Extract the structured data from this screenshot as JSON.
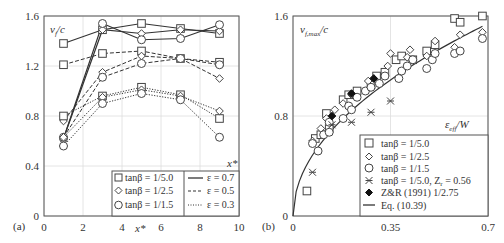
{
  "chart_data": [
    {
      "panel": "(a)",
      "type": "line",
      "ylabel": "v_f/c",
      "xlabel": "x*",
      "xlabel_inner": "x*",
      "xlim": [
        0,
        10
      ],
      "ylim": [
        0,
        1.6
      ],
      "xticks": [
        0,
        2,
        4,
        6,
        8,
        10
      ],
      "yticks": [
        0,
        0.4,
        0.8,
        1.2,
        1.6
      ],
      "grid": true,
      "x": [
        1,
        3,
        5,
        7,
        9
      ],
      "series": [
        {
          "name": "tanβ = 1/5.0, ε = 0.7",
          "marker": "square",
          "line": "solid",
          "values": [
            1.38,
            1.49,
            1.54,
            1.5,
            1.46
          ]
        },
        {
          "name": "tanβ = 1/2.5, ε = 0.7",
          "marker": "diamond",
          "line": "solid",
          "values": [
            0.62,
            1.49,
            1.46,
            1.49,
            1.48
          ]
        },
        {
          "name": "tanβ = 1/1.5, ε = 0.7",
          "marker": "circle",
          "line": "solid",
          "values": [
            0.62,
            1.54,
            1.41,
            1.42,
            1.53
          ]
        },
        {
          "name": "tanβ = 1/5.0, ε = 0.5",
          "marker": "square",
          "line": "dashed",
          "values": [
            1.21,
            1.3,
            1.32,
            1.26,
            1.23
          ]
        },
        {
          "name": "tanβ = 1/2.5, ε = 0.5",
          "marker": "diamond",
          "line": "dashed",
          "values": [
            0.76,
            1.15,
            1.28,
            1.26,
            1.1
          ]
        },
        {
          "name": "tanβ = 1/1.5, ε = 0.5",
          "marker": "circle",
          "line": "dashed",
          "values": [
            0.63,
            1.11,
            1.22,
            1.26,
            1.21
          ]
        },
        {
          "name": "tanβ = 1/5.0, ε = 0.3",
          "marker": "square",
          "line": "dotted",
          "values": [
            0.8,
            0.96,
            1.03,
            0.97,
            0.78
          ]
        },
        {
          "name": "tanβ = 1/2.5, ε = 0.3",
          "marker": "diamond",
          "line": "dotted",
          "values": [
            0.63,
            0.95,
            1.01,
            0.96,
            0.84
          ]
        },
        {
          "name": "tanβ = 1/1.5, ε = 0.3",
          "marker": "circle",
          "line": "dotted",
          "values": [
            0.56,
            0.9,
            0.98,
            0.93,
            0.63
          ]
        }
      ],
      "legend": {
        "position": "lower right",
        "markers": [
          "tanβ = 1/5.0",
          "tanβ = 1/2.5",
          "tanβ = 1/1.5"
        ],
        "lines": [
          "ε = 0.7",
          "ε = 0.5",
          "ε = 0.3"
        ]
      }
    },
    {
      "panel": "(b)",
      "type": "scatter",
      "ylabel": "v_f,max/c",
      "xlabel": "ε_eff/W",
      "xlim": [
        0,
        0.7
      ],
      "ylim": [
        0,
        1.6
      ],
      "xticks": [
        0,
        0.35,
        0.7
      ],
      "yticks": [
        0,
        0.8,
        1.6
      ],
      "grid": true,
      "series": [
        {
          "name": "tanβ = 1/5.0",
          "marker": "square",
          "points": [
            [
              0.05,
              0.2
            ],
            [
              0.08,
              0.62
            ],
            [
              0.1,
              0.65
            ],
            [
              0.12,
              0.82
            ],
            [
              0.13,
              0.7
            ],
            [
              0.18,
              0.93
            ],
            [
              0.2,
              0.97
            ],
            [
              0.23,
              1.0
            ],
            [
              0.28,
              1.05
            ],
            [
              0.3,
              1.12
            ],
            [
              0.33,
              1.15
            ],
            [
              0.37,
              1.25
            ],
            [
              0.39,
              1.28
            ],
            [
              0.43,
              1.25
            ],
            [
              0.48,
              1.32
            ],
            [
              0.51,
              1.37
            ],
            [
              0.58,
              1.58
            ],
            [
              0.6,
              1.55
            ],
            [
              0.68,
              1.6
            ]
          ]
        },
        {
          "name": "tanβ = 1/2.5",
          "marker": "diamond",
          "points": [
            [
              0.07,
              0.6
            ],
            [
              0.1,
              0.7
            ],
            [
              0.12,
              0.78
            ],
            [
              0.15,
              0.85
            ],
            [
              0.18,
              0.9
            ],
            [
              0.21,
              0.97
            ],
            [
              0.27,
              1.08
            ],
            [
              0.29,
              1.1
            ],
            [
              0.34,
              1.2
            ],
            [
              0.35,
              1.3
            ],
            [
              0.41,
              1.27
            ],
            [
              0.42,
              1.33
            ],
            [
              0.48,
              1.28
            ],
            [
              0.51,
              1.4
            ],
            [
              0.58,
              1.35
            ],
            [
              0.6,
              1.45
            ],
            [
              0.68,
              1.47
            ]
          ]
        },
        {
          "name": "tanβ = 1/1.5",
          "marker": "circle",
          "points": [
            [
              0.07,
              0.58
            ],
            [
              0.09,
              0.52
            ],
            [
              0.11,
              0.65
            ],
            [
              0.13,
              0.67
            ],
            [
              0.13,
              0.75
            ],
            [
              0.18,
              0.78
            ],
            [
              0.2,
              0.88
            ],
            [
              0.21,
              0.85
            ],
            [
              0.23,
              0.95
            ],
            [
              0.26,
              1.0
            ],
            [
              0.28,
              1.03
            ],
            [
              0.31,
              1.06
            ],
            [
              0.33,
              1.12
            ],
            [
              0.38,
              1.1
            ],
            [
              0.39,
              1.16
            ],
            [
              0.41,
              1.2
            ],
            [
              0.43,
              1.25
            ],
            [
              0.48,
              1.18
            ],
            [
              0.5,
              1.25
            ],
            [
              0.51,
              1.3
            ],
            [
              0.58,
              1.3
            ],
            [
              0.6,
              1.32
            ],
            [
              0.68,
              1.42
            ]
          ]
        },
        {
          "name": "tanβ = 1/5.0, Z_r = 0.56",
          "marker": "x-star",
          "points": [
            [
              0.07,
              0.35
            ],
            [
              0.14,
              0.73
            ],
            [
              0.21,
              0.75
            ],
            [
              0.28,
              0.83
            ],
            [
              0.35,
              0.92
            ]
          ]
        },
        {
          "name": "Z&R (1991) 1/2.75",
          "marker": "filled-diamond",
          "points": [
            [
              0.14,
              0.8
            ],
            [
              0.21,
              0.98
            ],
            [
              0.29,
              1.1
            ]
          ]
        },
        {
          "name": "Eq. (10.39)",
          "marker": "none",
          "line": "solid",
          "curve": "v = 1.84 * x^0.5 (approx.)"
        }
      ],
      "legend": {
        "position": "lower right",
        "entries": [
          "tanβ = 1/5.0",
          "tanβ = 1/2.5",
          "tanβ = 1/1.5",
          "tanβ = 1/5.0, Z_r = 0.56",
          "Z&R (1991) 1/2.75",
          "Eq. (10.39)"
        ]
      }
    }
  ],
  "panels": {
    "a": {
      "label": "(a)",
      "ylabel_main": "v",
      "ylabel_sub": "f",
      "ylabel_tail": "/c",
      "xlabel": "x*",
      "xlabel_inner": "x*",
      "yticks": [
        "0",
        "0.4",
        "0.8",
        "1.2",
        "1.6"
      ],
      "xticks": [
        "0",
        "2",
        "4",
        "6",
        "8",
        "10"
      ],
      "legend": {
        "m1": "tanβ = 1/5.0",
        "m2": "tanβ = 1/2.5",
        "m3": "tanβ = 1/1.5",
        "l1": "ε = 0.7",
        "l2": "ε = 0.5",
        "l3": "ε = 0.3"
      }
    },
    "b": {
      "label": "(b)",
      "ylabel_main": "v",
      "ylabel_sub": "f,max",
      "ylabel_tail": "/c",
      "xlabel_main": "ε",
      "xlabel_sub": "eff",
      "xlabel_tail": "/W",
      "yticks": [
        "0",
        "0.8",
        "1.6"
      ],
      "xticks": [
        "0",
        "0.35",
        "0.7"
      ],
      "legend": {
        "e1": "tanβ = 1/5.0",
        "e2": "tanβ = 1/2.5",
        "e3": "tanβ = 1/1.5",
        "e4": "tanβ = 1/5.0, Z",
        "e4sub": "r",
        "e4tail": " = 0.56",
        "e5": "Z&R (1991) 1/2.75",
        "e6": "Eq. (10.39)"
      }
    }
  }
}
